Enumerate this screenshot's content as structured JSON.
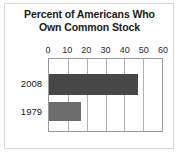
{
  "chart_data": {
    "type": "bar",
    "orientation": "horizontal",
    "title": "Percent of Americans Who Own Common Stock",
    "title_lines": [
      "Percent of Americans Who",
      "Own Common Stock"
    ],
    "categories": [
      "2008",
      "1979"
    ],
    "values": [
      47,
      17
    ],
    "series": [
      {
        "name": "Percent owning common stock",
        "values": [
          47,
          17
        ],
        "colors": [
          "#474747",
          "#6d6d6d"
        ]
      }
    ],
    "xlabel": "",
    "ylabel": "",
    "xlim": [
      0,
      60
    ],
    "xticks": [
      0,
      10,
      20,
      30,
      40,
      50,
      60
    ],
    "xtick_labels": [
      "0",
      "10",
      "20",
      "30",
      "40",
      "50",
      "60"
    ],
    "grid": true,
    "grid_axis": "x",
    "legend": false,
    "legend_position": "none",
    "bar_colors": {
      "2008": "#474747",
      "1979": "#6d6d6d"
    }
  },
  "style": {
    "background": "#ffffff",
    "frame_border": "#d9d9d9",
    "plot_border": "#9a9a9a",
    "gridline_color": "#b0b0b0",
    "text_color": "#1a1a1a"
  }
}
